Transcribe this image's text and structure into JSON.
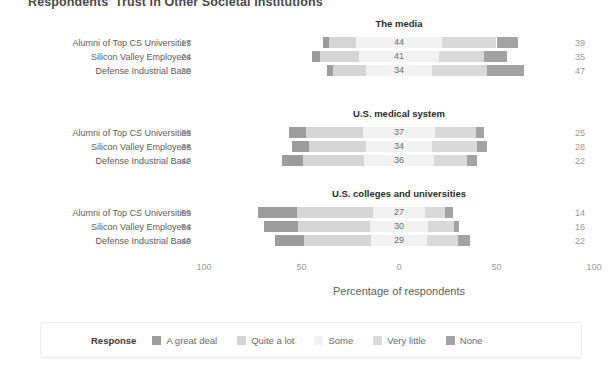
{
  "figure": {
    "title": "Respondents' Trust in Other Societal Institutions",
    "xlabel": "Percentage of respondents",
    "legend_title": "Response"
  },
  "axis": {
    "ticks": [
      "100",
      "50",
      "0",
      "50",
      "100"
    ]
  },
  "legend": {
    "items": [
      {
        "label": "A great deal",
        "color": "#9c9c9c"
      },
      {
        "label": "Quite a lot",
        "color": "#d5d5d5"
      },
      {
        "label": "Some",
        "color": "#f2f2f2"
      },
      {
        "label": "Very little",
        "color": "#d9d9d9"
      },
      {
        "label": "None",
        "color": "#a3a3a3"
      }
    ]
  },
  "chart_data": {
    "type": "bar",
    "subtype": "diverging-stacked-likert",
    "title": "Respondents' Trust in Other Societal Institutions",
    "xlabel": "Percentage of respondents",
    "ylabel": "",
    "xlim": [
      -100,
      100
    ],
    "xticks": [
      -100,
      -50,
      0,
      50,
      100
    ],
    "xticklabels": [
      "100",
      "50",
      "0",
      "50",
      "100"
    ],
    "grid": false,
    "legend_position": "bottom",
    "legend_title": "Response",
    "categories": [
      "A great deal",
      "Quite a lot",
      "Some",
      "Very little",
      "None"
    ],
    "groups": [
      "Alumni of Top CS Universities",
      "Silicon Valley Employees",
      "Defense Industrial Base"
    ],
    "panels": [
      {
        "title": "The media",
        "rows": [
          {
            "group": "Alumni of Top CS Universities",
            "left_total": 17,
            "middle": 44,
            "right_total": 39,
            "values": {
              "A great deal": 3,
              "Quite a lot": 14,
              "Some": 44,
              "Very little": 28,
              "None": 11
            }
          },
          {
            "group": "Silicon Valley Employees",
            "left_total": 24,
            "middle": 41,
            "right_total": 35,
            "values": {
              "A great deal": 4,
              "Quite a lot": 20,
              "Some": 41,
              "Very little": 23,
              "None": 12
            }
          },
          {
            "group": "Defense Industrial Base",
            "left_total": 20,
            "middle": 34,
            "right_total": 47,
            "values": {
              "A great deal": 3,
              "Quite a lot": 17,
              "Some": 34,
              "Very little": 28,
              "None": 19
            }
          }
        ]
      },
      {
        "title": "U.S. medical system",
        "rows": [
          {
            "group": "Alumni of Top CS Universities",
            "left_total": 38,
            "middle": 37,
            "right_total": 25,
            "values": {
              "A great deal": 9,
              "Quite a lot": 29,
              "Some": 37,
              "Very little": 21,
              "None": 4
            }
          },
          {
            "group": "Silicon Valley Employees",
            "left_total": 38,
            "middle": 34,
            "right_total": 28,
            "values": {
              "A great deal": 9,
              "Quite a lot": 29,
              "Some": 34,
              "Very little": 23,
              "None": 5
            }
          },
          {
            "group": "Defense Industrial Base",
            "left_total": 42,
            "middle": 36,
            "right_total": 22,
            "values": {
              "A great deal": 11,
              "Quite a lot": 31,
              "Some": 36,
              "Very little": 17,
              "None": 5
            }
          }
        ]
      },
      {
        "title": "U.S. colleges and universities",
        "rows": [
          {
            "group": "Alumni of Top CS Universities",
            "left_total": 59,
            "middle": 27,
            "right_total": 14,
            "values": {
              "A great deal": 20,
              "Quite a lot": 39,
              "Some": 27,
              "Very little": 10,
              "None": 4
            }
          },
          {
            "group": "Silicon Valley Employees",
            "left_total": 54,
            "middle": 30,
            "right_total": 16,
            "values": {
              "A great deal": 17,
              "Quite a lot": 37,
              "Some": 30,
              "Very little": 13,
              "None": 3
            }
          },
          {
            "group": "Defense Industrial Base",
            "left_total": 49,
            "middle": 29,
            "right_total": 22,
            "values": {
              "A great deal": 15,
              "Quite a lot": 34,
              "Some": 29,
              "Very little": 16,
              "None": 6
            }
          }
        ]
      }
    ]
  }
}
